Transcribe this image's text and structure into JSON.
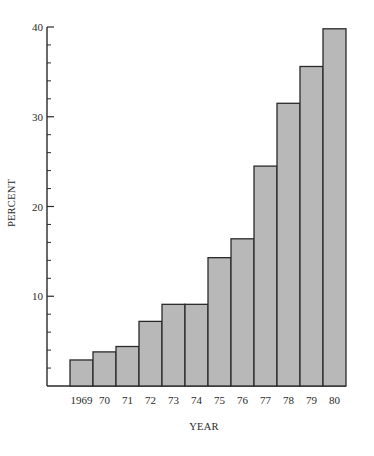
{
  "chart_data": {
    "type": "bar",
    "title": "",
    "xlabel": "YEAR",
    "ylabel": "PERCENT",
    "categories": [
      "1969",
      "70",
      "71",
      "72",
      "73",
      "74",
      "75",
      "76",
      "77",
      "78",
      "79",
      "80"
    ],
    "values": [
      2.9,
      3.8,
      4.4,
      7.2,
      9.1,
      9.1,
      14.3,
      16.4,
      24.5,
      31.5,
      35.6,
      39.8
    ],
    "ylim": [
      0,
      40
    ],
    "yticks": [
      10,
      20,
      30,
      40
    ],
    "y_minor_tick_step": 2,
    "grid": false,
    "legend": null,
    "bar_color": "#b8b8b8",
    "edge_color": "#2a2a2a"
  }
}
